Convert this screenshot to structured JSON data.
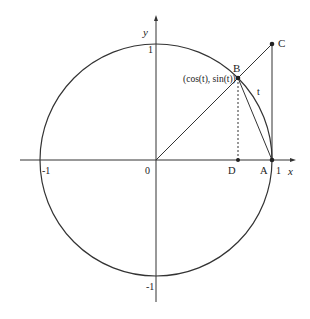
{
  "diagram": {
    "axes": {
      "x_label": "x",
      "y_label": "y",
      "origin_label": "0",
      "x_pos_tick": "1",
      "x_neg_tick": "-1",
      "y_pos_tick": "1",
      "y_neg_tick": "-1"
    },
    "points": {
      "B": "B",
      "B_coords": "(cos(t), sin(t))",
      "C": "C",
      "D": "D",
      "A": "A"
    },
    "arc_label": "t",
    "colors": {
      "stroke": "#333333",
      "background": "#ffffff"
    }
  }
}
